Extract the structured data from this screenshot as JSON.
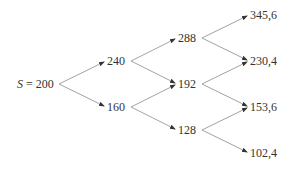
{
  "diagram": {
    "type": "binomial-tree",
    "line_color": "#8a8a8a",
    "text_color": "#333333",
    "root": {
      "variable": "S",
      "equals": " = ",
      "value": "200"
    },
    "levels": [
      {
        "nodes": [
          "240",
          "160"
        ]
      },
      {
        "nodes": [
          "288",
          "192",
          "128"
        ]
      },
      {
        "nodes": [
          "345,6",
          "230,4",
          "153,6",
          "102,4"
        ]
      }
    ],
    "edges": [
      {
        "from": "200",
        "to": "240"
      },
      {
        "from": "200",
        "to": "160"
      },
      {
        "from": "240",
        "to": "288"
      },
      {
        "from": "240",
        "to": "192"
      },
      {
        "from": "160",
        "to": "192"
      },
      {
        "from": "160",
        "to": "128"
      },
      {
        "from": "288",
        "to": "345,6"
      },
      {
        "from": "288",
        "to": "230,4"
      },
      {
        "from": "192",
        "to": "230,4"
      },
      {
        "from": "192",
        "to": "153,6"
      },
      {
        "from": "128",
        "to": "153,6"
      },
      {
        "from": "128",
        "to": "102,4"
      }
    ]
  }
}
